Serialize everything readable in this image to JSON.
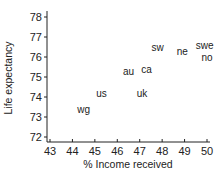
{
  "chart_data": {
    "type": "scatter",
    "title": "",
    "xlabel": "% Income received",
    "ylabel": "Life expectancy",
    "xlim": [
      43,
      50
    ],
    "ylim": [
      72,
      78
    ],
    "xticks": [
      43,
      44,
      45,
      46,
      47,
      48,
      49,
      50
    ],
    "yticks": [
      72,
      73,
      74,
      75,
      76,
      77,
      78
    ],
    "grid": false,
    "legend": null,
    "marker": "text-label",
    "points": [
      {
        "label": "wg",
        "x": 44.5,
        "y": 73.4
      },
      {
        "label": "us",
        "x": 45.3,
        "y": 74.2
      },
      {
        "label": "uk",
        "x": 47.1,
        "y": 74.2
      },
      {
        "label": "au",
        "x": 46.5,
        "y": 75.3
      },
      {
        "label": "ca",
        "x": 47.3,
        "y": 75.4
      },
      {
        "label": "sw",
        "x": 47.8,
        "y": 76.5
      },
      {
        "label": "ne",
        "x": 48.9,
        "y": 76.3
      },
      {
        "label": "swe",
        "x": 49.9,
        "y": 76.6
      },
      {
        "label": "no",
        "x": 50.0,
        "y": 76.0
      }
    ]
  },
  "colors": {
    "ink": "#222222",
    "background": "#ffffff"
  }
}
